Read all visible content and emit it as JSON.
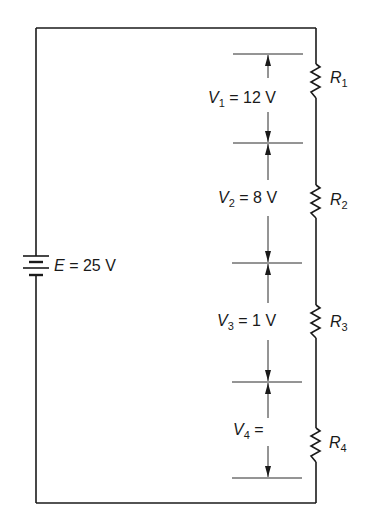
{
  "diagram": {
    "type": "series-circuit",
    "source": {
      "symbol": "E",
      "value": "25 V",
      "label": "E = 25 V",
      "icon": "battery-icon"
    },
    "resistors": [
      {
        "symbol": "R",
        "index": "1",
        "icon": "resistor-icon"
      },
      {
        "symbol": "R",
        "index": "2",
        "icon": "resistor-icon"
      },
      {
        "symbol": "R",
        "index": "3",
        "icon": "resistor-icon"
      },
      {
        "symbol": "R",
        "index": "4",
        "icon": "resistor-icon"
      }
    ],
    "voltage_drops": [
      {
        "symbol": "V",
        "index": "1",
        "value": "= 12 V"
      },
      {
        "symbol": "V",
        "index": "2",
        "value": "= 8 V"
      },
      {
        "symbol": "V",
        "index": "3",
        "value": "= 1 V"
      },
      {
        "symbol": "V",
        "index": "4",
        "value": "="
      }
    ],
    "colors": {
      "line": "#1a1a1a",
      "background": "#ffffff"
    }
  }
}
